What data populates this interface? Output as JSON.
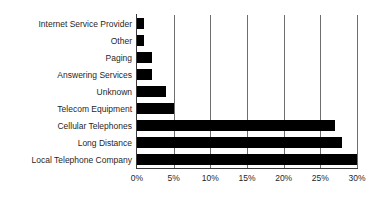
{
  "chart_data": {
    "type": "bar",
    "orientation": "horizontal",
    "title": "",
    "subtitle": "",
    "xlabel": "",
    "ylabel": "",
    "xlim": [
      0,
      30
    ],
    "grid": true,
    "legend": false,
    "legend_position": "none",
    "bar_color": "#000000",
    "gridline_color": "#6e6e6e",
    "axis_color": "#3a3a3a",
    "xticks": [
      0,
      5,
      10,
      15,
      20,
      25,
      30
    ],
    "xtick_labels": [
      "0%",
      "5%",
      "10%",
      "15%",
      "20%",
      "25%",
      "30%"
    ],
    "categories": [
      "Internet Service Provider",
      "Other",
      "Paging",
      "Answering Services",
      "Unknown",
      "Telecom Equipment",
      "Cellular Telephones",
      "Long Distance",
      "Local Telephone Company"
    ],
    "values": [
      1,
      1,
      2,
      2,
      4,
      5,
      27,
      28,
      30
    ]
  }
}
